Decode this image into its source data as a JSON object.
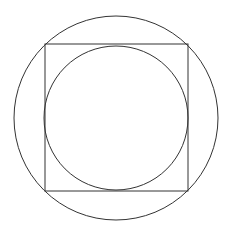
{
  "diagram": {
    "background": "#ffffff",
    "stroke_color": "#333333",
    "stroke_width": 1,
    "outer_circle": {
      "cx": 116,
      "cy": 118,
      "r": 102
    },
    "square": {
      "x": 45,
      "y": 44,
      "width": 143,
      "height": 147
    },
    "inner_circle": {
      "cx": 116,
      "cy": 118,
      "r": 72
    }
  }
}
